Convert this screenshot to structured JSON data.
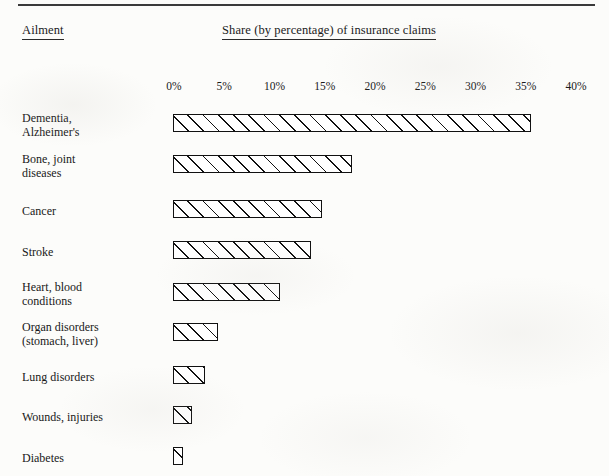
{
  "page": {
    "background_color": "#fcfcfa",
    "ink_color": "#111111",
    "rule_color": "#3a3a3a"
  },
  "headers": {
    "ailment": "Ailment",
    "share": "Share (by percentage) of insurance claims"
  },
  "chart_data": {
    "type": "bar",
    "orientation": "horizontal",
    "title": "Share (by percentage) of insurance claims",
    "xlabel": "Share (by percentage) of insurance claims",
    "ylabel": "Ailment",
    "xlim": [
      0,
      40
    ],
    "grid": false,
    "legend": null,
    "tick_labels": [
      "0%",
      "5%",
      "10%",
      "15%",
      "20%",
      "25%",
      "30%",
      "35%",
      "40%"
    ],
    "tick_values": [
      0,
      5,
      10,
      15,
      20,
      25,
      30,
      35,
      40
    ],
    "bar_style": "diagonal-hatch",
    "categories": [
      "Dementia,\nAlzheimer's",
      "Bone, joint\ndiseases",
      "Cancer",
      "Stroke",
      "Heart, blood\nconditions",
      "Organ disorders\n(stomach, liver)",
      "Lung disorders",
      "Wounds, injuries",
      "Diabetes"
    ],
    "values": [
      35.6,
      17.8,
      14.8,
      13.7,
      10.6,
      4.5,
      3.2,
      1.9,
      1.0
    ]
  },
  "rows": [
    {
      "label": "Dementia,\nAlzheimer's",
      "value": 35.6,
      "label_top": 112,
      "bar_top": 114
    },
    {
      "label": "Bone, joint\ndiseases",
      "value": 17.8,
      "label_top": 153,
      "bar_top": 155
    },
    {
      "label": "Cancer",
      "value": 14.8,
      "label_top": 205,
      "bar_top": 200
    },
    {
      "label": "Stroke",
      "value": 13.7,
      "label_top": 246,
      "bar_top": 241
    },
    {
      "label": "Heart, blood\nconditions",
      "value": 10.6,
      "label_top": 281,
      "bar_top": 283
    },
    {
      "label": "Organ disorders\n(stomach, liver)",
      "value": 4.5,
      "label_top": 321,
      "bar_top": 323
    },
    {
      "label": "Lung disorders",
      "value": 3.2,
      "label_top": 371,
      "bar_top": 366
    },
    {
      "label": "Wounds, injuries",
      "value": 1.9,
      "label_top": 411,
      "bar_top": 406
    },
    {
      "label": "Diabetes",
      "value": 1.0,
      "label_top": 452,
      "bar_top": 447
    }
  ],
  "geometry": {
    "axis_origin_x": 173,
    "px_per_percent": 10.05,
    "bar_height": 18
  }
}
